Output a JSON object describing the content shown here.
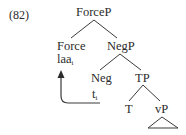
{
  "example_number": "(82)",
  "tree": {
    "root": "ForceP",
    "nodes": {
      "forcep": "ForceP",
      "force": "Force",
      "force_word": "laa",
      "force_word_index": "i",
      "negp": "NegP",
      "neg": "Neg",
      "trace": "t",
      "trace_index": "i",
      "tp": "TP",
      "t": "T",
      "vp": "vP"
    },
    "edges": [
      [
        "ForceP",
        "Force"
      ],
      [
        "ForceP",
        "NegP"
      ],
      [
        "NegP",
        "Neg"
      ],
      [
        "NegP",
        "TP"
      ],
      [
        "TP",
        "T"
      ],
      [
        "TP",
        "vP"
      ]
    ],
    "movement_arrow": {
      "from": "t_i",
      "to": "laa_i"
    },
    "triangle_under": "vP"
  },
  "colors": {
    "text": "#2b2b2b",
    "lines": "#3a3a3a",
    "background": "#ffffff"
  }
}
